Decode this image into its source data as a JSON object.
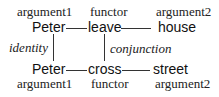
{
  "top": {
    "roles": [
      "argument1",
      "functor",
      "argument2"
    ],
    "words": [
      "Peter",
      "leave",
      "house"
    ]
  },
  "relations": {
    "left": "identity",
    "right": "conjunction"
  },
  "bottom": {
    "words": [
      "Peter",
      "cross",
      "street"
    ],
    "roles": [
      "argument1",
      "functor",
      "argument2"
    ]
  }
}
